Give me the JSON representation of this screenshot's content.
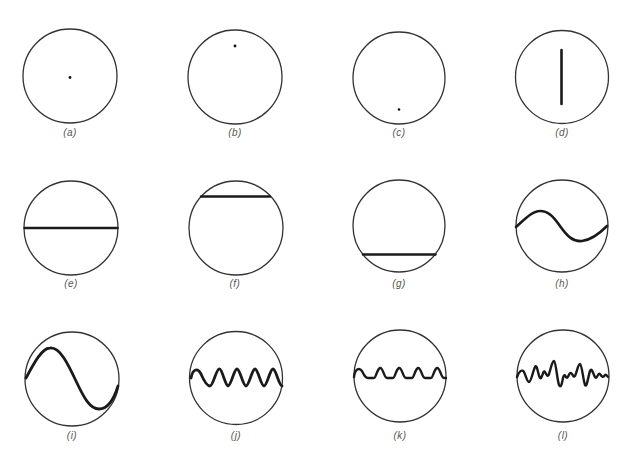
{
  "figure": {
    "colors": {
      "background": "#ffffff",
      "circle_stroke": "#333333",
      "trace": "#1a1a1a",
      "label": "#555555"
    },
    "panels": [
      {
        "id": "a",
        "label": "(a)",
        "trace": "dot",
        "dot_position": "center",
        "cx": 70,
        "cy": 76
      },
      {
        "id": "b",
        "label": "(b)",
        "trace": "dot",
        "dot_position": "upper-center",
        "cx": 235,
        "cy": 76
      },
      {
        "id": "c",
        "label": "(c)",
        "trace": "dot",
        "dot_position": "lower-center",
        "cx": 399,
        "cy": 76
      },
      {
        "id": "d",
        "label": "(d)",
        "trace": "vertical-line",
        "cx": 562,
        "cy": 76
      },
      {
        "id": "e",
        "label": "(e)",
        "trace": "horizontal-line",
        "line_position": "center",
        "cx": 71,
        "cy": 228
      },
      {
        "id": "f",
        "label": "(f)",
        "trace": "horizontal-line",
        "line_position": "top",
        "cx": 235,
        "cy": 228
      },
      {
        "id": "g",
        "label": "(g)",
        "trace": "horizontal-line",
        "line_position": "bottom",
        "cx": 399,
        "cy": 228
      },
      {
        "id": "h",
        "label": "(h)",
        "trace": "sine-wave",
        "cycles": 1,
        "amplitude": "small",
        "cx": 562,
        "cy": 228
      },
      {
        "id": "i",
        "label": "(i)",
        "trace": "sine-wave",
        "cycles": 1,
        "amplitude": "large",
        "cx": 72,
        "cy": 379
      },
      {
        "id": "j",
        "label": "(j)",
        "trace": "sine-wave",
        "cycles": 5,
        "amplitude": "small",
        "cx": 236,
        "cy": 379
      },
      {
        "id": "k",
        "label": "(k)",
        "trace": "pulse-train",
        "cycles": 5,
        "cx": 400,
        "cy": 377
      },
      {
        "id": "l",
        "label": "(l)",
        "trace": "complex-irregular-wave",
        "cx": 563,
        "cy": 376
      }
    ]
  }
}
